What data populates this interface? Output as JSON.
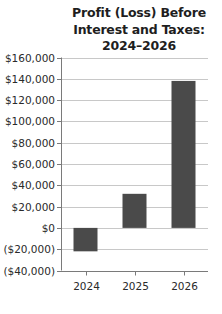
{
  "chart_data": {
    "type": "bar",
    "title_lines": [
      "Profit (Loss) Before",
      "Interest and Taxes:",
      "2024–2026"
    ],
    "title": "Profit (Loss) Before Interest and Taxes: 2024–2026",
    "xlabel": "",
    "ylabel": "",
    "categories": [
      "2024",
      "2025",
      "2026"
    ],
    "values": [
      -22000,
      32000,
      138000
    ],
    "ylim": [
      -40000,
      160000
    ],
    "yticks": [
      160000,
      140000,
      120000,
      100000,
      80000,
      60000,
      40000,
      20000,
      0,
      -20000,
      -40000
    ],
    "ytick_labels": [
      "$160,000",
      "$140,000",
      "$120,000",
      "$100,000",
      "$80,000",
      "$60,000",
      "$40,000",
      "$20,000",
      "$0",
      "($20,000)",
      "($40,000)"
    ],
    "grid": true,
    "legend": null,
    "colors": {
      "bar": "#4a4a4a",
      "grid": "#c8c8c8",
      "axis": "#7a7a7a",
      "text": "#2a2a2a"
    }
  }
}
